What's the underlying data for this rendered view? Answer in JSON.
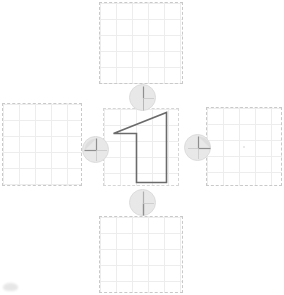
{
  "app": {
    "title": "Shape Transform Canvas",
    "background_color": "#ffffff"
  },
  "canvas": {
    "width": 284,
    "height": 295,
    "grid": {
      "cell_size": 16,
      "line_color": "#ededed",
      "border_color": "#c9c9c9",
      "border_style": "dashed"
    }
  },
  "panels": [
    {
      "id": "panel-top",
      "name": "top-grid-panel",
      "label": "Top Panel",
      "x": 99,
      "y": 2,
      "width": 84,
      "height": 82,
      "content": "empty",
      "has_center_dot": false
    },
    {
      "id": "panel-left",
      "name": "left-grid-panel",
      "label": "Left Panel",
      "x": 2,
      "y": 103,
      "width": 80,
      "height": 83,
      "content": "empty",
      "has_center_dot": false
    },
    {
      "id": "panel-center",
      "name": "center-grid-panel",
      "label": "Center Panel",
      "x": 103,
      "y": 108,
      "width": 76,
      "height": 78,
      "content": "shape",
      "has_center_dot": false
    },
    {
      "id": "panel-right",
      "name": "right-grid-panel",
      "label": "Right Panel",
      "x": 206,
      "y": 107,
      "width": 76,
      "height": 79,
      "content": "empty",
      "has_center_dot": true
    },
    {
      "id": "panel-bottom",
      "name": "bottom-grid-panel",
      "label": "Bottom Panel",
      "x": 99,
      "y": 216,
      "width": 84,
      "height": 77,
      "content": "empty",
      "has_center_dot": false
    }
  ],
  "shape": {
    "name": "digit-one-polygon",
    "label": "Shape 1",
    "stroke_color": "#6b6b6b",
    "stroke_width": 1.6,
    "fill": "none",
    "points": "113.5,133.5 136.5,133.5 136.5,182.5 166.5,182.5 166.5,112.5 113.5,133.5",
    "vertices": [
      [
        113.5,
        133.5
      ],
      [
        136.5,
        133.5
      ],
      [
        136.5,
        182.5
      ],
      [
        166.5,
        182.5
      ],
      [
        166.5,
        112.5
      ]
    ]
  },
  "handles": [
    {
      "id": "handle-top",
      "name": "rotate-handle-top",
      "label": "Top Handle",
      "x": 129,
      "y": 84,
      "icon": "clock-hand-up-icon",
      "hand_angle_deg": 0,
      "arc": "none",
      "fill": "#e8e8e8",
      "stroke": "#9a9a9a"
    },
    {
      "id": "handle-left",
      "name": "rotate-handle-left",
      "label": "Left Handle",
      "x": 82,
      "y": 136,
      "icon": "quarter-arc-up-left-icon",
      "hand_angle_deg": 270,
      "arc": "up-left",
      "fill": "#e8e8e8",
      "stroke": "#9a9a9a"
    },
    {
      "id": "handle-right",
      "name": "rotate-handle-right",
      "label": "Right Handle",
      "x": 184,
      "y": 134,
      "icon": "quarter-arc-up-right-icon",
      "hand_angle_deg": 90,
      "arc": "up-right",
      "fill": "#e8e8e8",
      "stroke": "#9a9a9a"
    },
    {
      "id": "handle-bottom",
      "name": "rotate-handle-bottom",
      "label": "Bottom Handle",
      "x": 129,
      "y": 189,
      "icon": "clock-hand-down-icon",
      "hand_angle_deg": 180,
      "arc": "none",
      "fill": "#e8e8e8",
      "stroke": "#9a9a9a"
    }
  ],
  "artifacts": {
    "corner_smudge": {
      "name": "corner-smudge",
      "visible": true,
      "color": "#d2d2d2"
    }
  }
}
